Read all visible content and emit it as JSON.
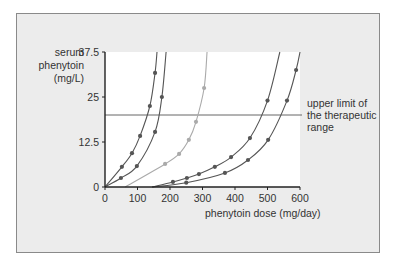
{
  "chart_data": {
    "type": "line",
    "title": "",
    "xlabel": "phenytoin dose (mg/day)",
    "ylabel": "serum phenytoin (mg/L)",
    "xlim": [
      0,
      600
    ],
    "ylim": [
      0,
      37.5
    ],
    "x_ticks": [
      "0",
      "100",
      "200",
      "300",
      "400",
      "500",
      "600"
    ],
    "y_ticks": [
      "0",
      "12.5",
      "25",
      "37.5"
    ],
    "grid": false,
    "legend": null,
    "reference_line": {
      "y": 20,
      "label": "upper limit of the therapeutic range"
    },
    "series": [
      {
        "name": "patient 1",
        "color": "#555555",
        "points": [
          [
            0,
            0
          ],
          [
            52,
            5.6
          ],
          [
            83,
            9.4
          ],
          [
            108,
            14.2
          ],
          [
            138,
            22.5
          ],
          [
            154,
            31.7
          ],
          [
            160,
            37.5
          ]
        ]
      },
      {
        "name": "patient 2",
        "color": "#555555",
        "points": [
          [
            0,
            0
          ],
          [
            49,
            2.5
          ],
          [
            98,
            5.8
          ],
          [
            154,
            15.3
          ],
          [
            175,
            25
          ],
          [
            188,
            37.5
          ]
        ]
      },
      {
        "name": "patient 3",
        "color": "#aaaaaa",
        "points": [
          [
            62,
            0
          ],
          [
            185,
            6.4
          ],
          [
            228,
            9.2
          ],
          [
            258,
            13.1
          ],
          [
            280,
            18.1
          ],
          [
            305,
            27.5
          ],
          [
            314,
            37.5
          ]
        ]
      },
      {
        "name": "patient 4",
        "color": "#555555",
        "points": [
          [
            145,
            0
          ],
          [
            209,
            1.4
          ],
          [
            252,
            2.5
          ],
          [
            289,
            3.6
          ],
          [
            338,
            5.6
          ],
          [
            388,
            8.3
          ],
          [
            446,
            13.6
          ],
          [
            500,
            24
          ],
          [
            538,
            37.5
          ]
        ]
      },
      {
        "name": "patient 5",
        "color": "#555555",
        "points": [
          [
            145,
            0
          ],
          [
            250,
            1.2
          ],
          [
            369,
            3.9
          ],
          [
            440,
            7.5
          ],
          [
            502,
            13.1
          ],
          [
            560,
            24
          ],
          [
            588,
            32.5
          ],
          [
            600,
            37.5
          ]
        ]
      }
    ]
  },
  "labels": {
    "ylabel_lines": [
      "serum",
      "phenytoin",
      "(mg/L)"
    ],
    "xlabel": "phenytoin dose (mg/day)",
    "annotation_lines": [
      "upper limit of",
      "the therapeutic",
      "range"
    ]
  }
}
